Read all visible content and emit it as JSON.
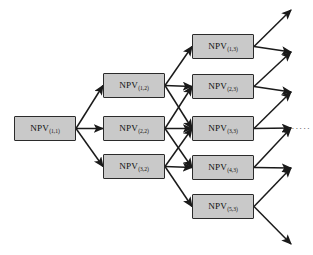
{
  "figure": {
    "node_label_base": "NPV",
    "colors": {
      "node_fill": "#c9c9c9",
      "node_border": "#2b2b2b",
      "arrow": "#1a1a1a",
      "background": "#ffffff",
      "ellipsis": "#3a3a3a"
    },
    "ellipsis_text": "......"
  },
  "stages": [
    {
      "index": 1,
      "nodes": [
        {
          "id": "n1_1",
          "label": "NPV",
          "sub": "(1,1)",
          "x": 14,
          "y": 116,
          "w": 62,
          "h": 25
        }
      ]
    },
    {
      "index": 2,
      "nodes": [
        {
          "id": "n1_2",
          "label": "NPV",
          "sub": "(1,2)",
          "x": 103,
          "y": 73,
          "w": 62,
          "h": 25
        },
        {
          "id": "n2_2",
          "label": "NPV",
          "sub": "(2,2)",
          "x": 103,
          "y": 116,
          "w": 62,
          "h": 25
        },
        {
          "id": "n3_2",
          "label": "NPV",
          "sub": "(3,2)",
          "x": 103,
          "y": 154,
          "w": 62,
          "h": 25
        }
      ]
    },
    {
      "index": 3,
      "nodes": [
        {
          "id": "n1_3",
          "label": "NPV",
          "sub": "(1,3)",
          "x": 192,
          "y": 34,
          "w": 62,
          "h": 25
        },
        {
          "id": "n2_3",
          "label": "NPV",
          "sub": "(2,3)",
          "x": 192,
          "y": 74,
          "w": 62,
          "h": 25
        },
        {
          "id": "n3_3",
          "label": "NPV",
          "sub": "(3,3)",
          "x": 192,
          "y": 116,
          "w": 62,
          "h": 25
        },
        {
          "id": "n4_3",
          "label": "NPV",
          "sub": "(4,3)",
          "x": 192,
          "y": 155,
          "w": 62,
          "h": 25
        },
        {
          "id": "n5_3",
          "label": "NPV",
          "sub": "(5,3)",
          "x": 192,
          "y": 194,
          "w": 62,
          "h": 25
        }
      ]
    }
  ],
  "edges": [
    {
      "from": "n1_1",
      "to": "n1_2"
    },
    {
      "from": "n1_1",
      "to": "n2_2"
    },
    {
      "from": "n1_1",
      "to": "n3_2"
    },
    {
      "from": "n1_2",
      "to": "n1_3"
    },
    {
      "from": "n1_2",
      "to": "n2_3"
    },
    {
      "from": "n1_2",
      "to": "n3_3"
    },
    {
      "from": "n2_2",
      "to": "n2_3"
    },
    {
      "from": "n2_2",
      "to": "n3_3"
    },
    {
      "from": "n2_2",
      "to": "n4_3"
    },
    {
      "from": "n3_2",
      "to": "n3_3"
    },
    {
      "from": "n3_2",
      "to": "n4_3"
    },
    {
      "from": "n3_2",
      "to": "n5_3"
    }
  ],
  "open_edges": [
    {
      "from": "n1_3",
      "to_x": 291,
      "to_y": 10
    },
    {
      "from": "n1_3",
      "to_x": 291,
      "to_y": 52
    },
    {
      "from": "n2_3",
      "to_x": 291,
      "to_y": 52
    },
    {
      "from": "n2_3",
      "to_x": 291,
      "to_y": 92
    },
    {
      "from": "n3_3",
      "to_x": 291,
      "to_y": 92
    },
    {
      "from": "n3_3",
      "to_x": 291,
      "to_y": 128
    },
    {
      "from": "n4_3",
      "to_x": 291,
      "to_y": 128
    },
    {
      "from": "n4_3",
      "to_x": 291,
      "to_y": 168
    },
    {
      "from": "n5_3",
      "to_x": 291,
      "to_y": 168
    },
    {
      "from": "n5_3",
      "to_x": 291,
      "to_y": 244
    }
  ],
  "ellipsis": {
    "text": "......",
    "x": 288,
    "y": 122
  }
}
